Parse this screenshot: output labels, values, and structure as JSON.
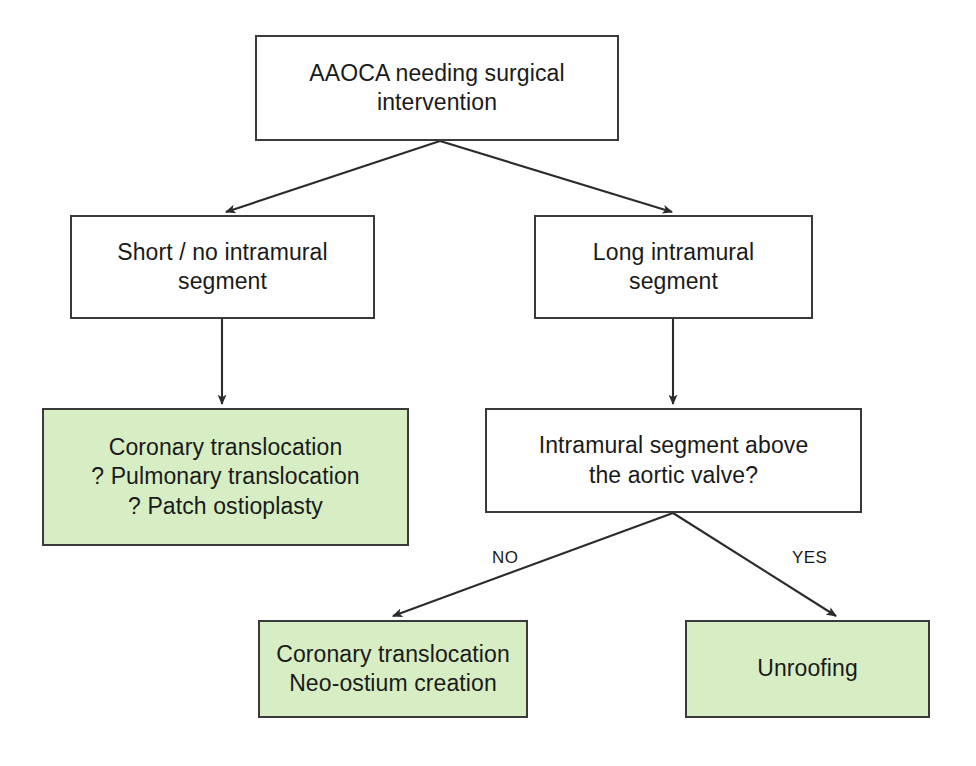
{
  "diagram": {
    "type": "flowchart",
    "colors": {
      "outcome_fill": "#d7eec5",
      "node_border": "#3a3a3a",
      "node_fill": "#ffffff",
      "edge_stroke": "#2b2b2b",
      "text": "#1a1a1a",
      "background": "#ffffff"
    },
    "nodes": [
      {
        "id": "root",
        "kind": "process",
        "lines": [
          "AAOCA needing surgical",
          "intervention"
        ],
        "box": {
          "x": 255,
          "y": 35,
          "w": 364,
          "h": 106
        }
      },
      {
        "id": "short_no_intramural",
        "kind": "process",
        "lines": [
          "Short / no intramural",
          "segment"
        ],
        "box": {
          "x": 70,
          "y": 215,
          "w": 305,
          "h": 104
        }
      },
      {
        "id": "long_intramural",
        "kind": "process",
        "lines": [
          "Long intramural",
          "segment"
        ],
        "box": {
          "x": 534,
          "y": 215,
          "w": 279,
          "h": 104
        }
      },
      {
        "id": "left_outcome",
        "kind": "outcome",
        "lines": [
          "Coronary translocation",
          "? Pulmonary translocation",
          "? Patch ostioplasty"
        ],
        "box": {
          "x": 42,
          "y": 408,
          "w": 367,
          "h": 138
        }
      },
      {
        "id": "decision_above_valve",
        "kind": "decision",
        "lines": [
          "Intramural segment above",
          "the aortic valve?"
        ],
        "box": {
          "x": 485,
          "y": 408,
          "w": 377,
          "h": 105
        }
      },
      {
        "id": "no_outcome",
        "kind": "outcome",
        "lines": [
          "Coronary translocation",
          "Neo-ostium creation"
        ],
        "box": {
          "x": 258,
          "y": 620,
          "w": 270,
          "h": 98
        }
      },
      {
        "id": "yes_outcome",
        "kind": "outcome",
        "lines": [
          "Unroofing"
        ],
        "box": {
          "x": 685,
          "y": 620,
          "w": 245,
          "h": 98
        }
      }
    ],
    "edges": [
      {
        "id": "root-to-short",
        "from": "root",
        "to": "short_no_intramural",
        "label": "",
        "path": "M 440 141 L 226 212"
      },
      {
        "id": "root-to-long",
        "from": "root",
        "to": "long_intramural",
        "label": "",
        "path": "M 440 141 L 672 212"
      },
      {
        "id": "short-to-left-outcome",
        "from": "short_no_intramural",
        "to": "left_outcome",
        "label": "",
        "path": "M 222 319 L 222 404"
      },
      {
        "id": "long-to-decision",
        "from": "long_intramural",
        "to": "decision_above_valve",
        "label": "",
        "path": "M 673 319 L 673 404"
      },
      {
        "id": "decision-no",
        "from": "decision_above_valve",
        "to": "no_outcome",
        "label": "NO",
        "path": "M 673 513 L 393 616"
      },
      {
        "id": "decision-yes",
        "from": "decision_above_valve",
        "to": "yes_outcome",
        "label": "YES",
        "path": "M 673 513 L 836 616"
      }
    ],
    "edge_labels": [
      {
        "id": "label-no",
        "text": "NO",
        "x": 492,
        "y": 548
      },
      {
        "id": "label-yes",
        "text": "YES",
        "x": 792,
        "y": 548
      }
    ]
  }
}
